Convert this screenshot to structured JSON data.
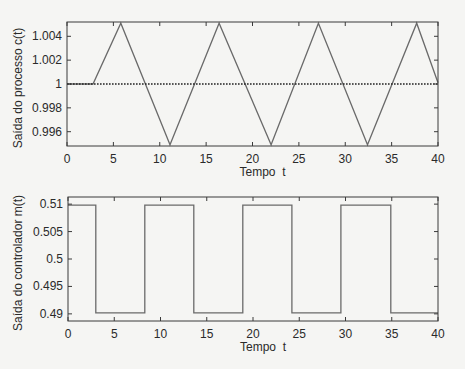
{
  "figure": {
    "background": "#f5f5f3",
    "line_color": "#6a6a6a",
    "frame_color": "#3a3a3a",
    "ref_line_color": "#222222"
  },
  "chart_data": [
    {
      "type": "line",
      "title": "",
      "xlabel": "Tempo  t",
      "ylabel": "Saída do processo c(t)",
      "xlim": [
        0,
        40
      ],
      "ylim": [
        0.9948,
        1.0052
      ],
      "xticks": [
        0,
        5,
        10,
        15,
        20,
        25,
        30,
        35,
        40
      ],
      "xtick_labels": [
        "0",
        "5",
        "10",
        "15",
        "20",
        "25",
        "30",
        "35",
        "40"
      ],
      "yticks": [
        0.996,
        0.998,
        1.0,
        1.002,
        1.004
      ],
      "ytick_labels": [
        "0.996",
        "0.998",
        "1",
        "1.002",
        "1.004"
      ],
      "grid": false,
      "series": [
        {
          "name": "c(t)",
          "style": "solid",
          "x": [
            0,
            2.8,
            5.8,
            11.1,
            16.4,
            22.0,
            27.1,
            32.4,
            37.7,
            40
          ],
          "y": [
            1.0,
            1.0,
            1.0051,
            0.9949,
            1.0051,
            0.9949,
            1.0051,
            0.9949,
            1.0051,
            1.0001
          ]
        },
        {
          "name": "setpoint",
          "style": "dotted",
          "x": [
            0,
            40
          ],
          "y": [
            1.0,
            1.0
          ]
        }
      ]
    },
    {
      "type": "line",
      "title": "",
      "xlabel": "Tempo  t",
      "ylabel": "Saída do controlador m(t)",
      "xlim": [
        0,
        40
      ],
      "ylim": [
        0.4887,
        0.5113
      ],
      "xticks": [
        0,
        5,
        10,
        15,
        20,
        25,
        30,
        35,
        40
      ],
      "xtick_labels": [
        "0",
        "5",
        "10",
        "15",
        "20",
        "25",
        "30",
        "35",
        "40"
      ],
      "yticks": [
        0.49,
        0.495,
        0.5,
        0.505,
        0.51
      ],
      "ytick_labels": [
        "0.49",
        "0.495",
        "0.5",
        "0.505",
        "0.51"
      ],
      "grid": false,
      "series": [
        {
          "name": "m(t)",
          "style": "step",
          "x": [
            0,
            3.0,
            3.0,
            8.3,
            8.3,
            13.6,
            13.6,
            18.9,
            18.9,
            24.2,
            24.2,
            29.5,
            29.5,
            34.9,
            34.9,
            40
          ],
          "y": [
            0.5098,
            0.5098,
            0.4902,
            0.4902,
            0.5098,
            0.5098,
            0.4902,
            0.4902,
            0.5098,
            0.5098,
            0.4902,
            0.4902,
            0.5098,
            0.5098,
            0.4902,
            0.4902
          ]
        }
      ]
    }
  ]
}
